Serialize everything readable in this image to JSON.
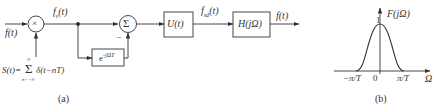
{
  "diagram_a": {
    "caption": "(a)",
    "input_label": "f(t)",
    "multiplier_symbol": "×",
    "sampled_label_main": "f",
    "sampled_label_sub": "s",
    "sampled_label_arg": "(t)",
    "summer_symbol": "Σ",
    "summer_minus_sign": "–",
    "delay_block_base": "e",
    "delay_block_exp": "-jΩT",
    "block_u": "U(t)",
    "u_output_main": "f",
    "u_output_sub": "sd",
    "u_output_arg": "(t)",
    "block_h": "H(jΩ)",
    "output_label": "f(t)",
    "sampling_func_lhs": "S(t)=",
    "sampling_sum_symbol": "Σ",
    "sampling_sum_upper": "∞",
    "sampling_sum_lower": "n=−∞",
    "sampling_func_body": "δ(t−nT)"
  },
  "diagram_b": {
    "caption": "(b)",
    "y_axis_label": "F(jΩ)",
    "peak_label": "1",
    "origin_label": "0",
    "left_tick_label": "−π/T",
    "right_tick_label": "π/T",
    "x_axis_label": "Ω"
  },
  "colors": {
    "stroke": "#333333",
    "background": "#ffffff"
  }
}
